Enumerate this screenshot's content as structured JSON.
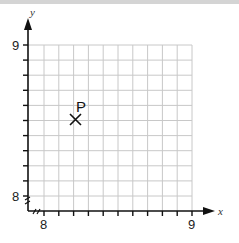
{
  "chart_data": {
    "type": "scatter",
    "title": "",
    "xlabel": "x",
    "ylabel": "y",
    "xlim": [
      7.9,
      9.0
    ],
    "ylim": [
      7.9,
      9.0
    ],
    "grid": true,
    "x_tick_labels": [
      "8",
      "9"
    ],
    "y_tick_labels": [
      "8",
      "9"
    ],
    "x_tick_step": 0.1,
    "y_tick_step": 0.1,
    "axis_break": true,
    "points": [
      {
        "label": "P",
        "x": 8.2,
        "y": 8.5,
        "marker": "x"
      }
    ]
  },
  "labels": {
    "x_axis": "x",
    "y_axis": "y",
    "x_tick_8": "8",
    "x_tick_9": "9",
    "y_tick_8": "8",
    "y_tick_9": "9",
    "point_p": "P"
  }
}
